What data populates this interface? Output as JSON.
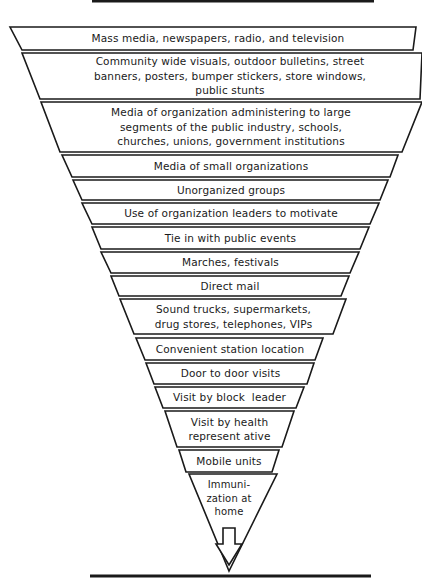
{
  "diagram": {
    "type": "inverted-funnel",
    "colors": {
      "stroke": "#1a1a1a",
      "fill": "#ffffff",
      "text": "#1a1a1a"
    },
    "bands": [
      {
        "lines": [
          "Mass media, newspapers, radio, and television"
        ]
      },
      {
        "lines": [
          "Community wide visuals, outdoor bulletins, street",
          "banners, posters, bumper stickers, store windows,",
          "public stunts"
        ]
      },
      {
        "lines": [
          "Media of organization administering to large",
          "segments of the public industry, schools,",
          "churches, unions, government institutions"
        ]
      },
      {
        "lines": [
          "Media of small organizations"
        ]
      },
      {
        "lines": [
          "Unorganized groups"
        ]
      },
      {
        "lines": [
          "Use of organization leaders to motivate"
        ]
      },
      {
        "lines": [
          "Tie in with public events"
        ]
      },
      {
        "lines": [
          "Marches, festivals"
        ]
      },
      {
        "lines": [
          "Direct mail"
        ]
      },
      {
        "lines": [
          "Sound trucks, supermarkets,",
          "drug stores, telephones, VIPs"
        ]
      },
      {
        "lines": [
          "Convenient station location"
        ]
      },
      {
        "lines": [
          "Door to door visits"
        ]
      },
      {
        "lines": [
          "Visit by block  leader"
        ]
      },
      {
        "lines": [
          "Visit by health",
          "represent ative"
        ]
      },
      {
        "lines": [
          "Mobile units"
        ]
      },
      {
        "lines": [
          "Immuni-",
          "zation at",
          "home"
        ]
      }
    ],
    "arrow_icon": "down-arrow-outline"
  }
}
